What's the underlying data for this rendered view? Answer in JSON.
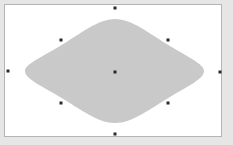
{
  "canvas": {
    "background_color": "#ffffff",
    "outer_color": "#e6e6e6",
    "border_color": "#b4b4b4"
  },
  "shape": {
    "type": "rounded-diamond",
    "fill_color": "#c9c9c9",
    "selected": true
  },
  "selection_handles": [
    {
      "name": "top",
      "x": 115,
      "y": 8
    },
    {
      "name": "top-left",
      "x": 61,
      "y": 40
    },
    {
      "name": "top-right",
      "x": 168,
      "y": 40
    },
    {
      "name": "left",
      "x": 8,
      "y": 71
    },
    {
      "name": "center",
      "x": 115,
      "y": 72
    },
    {
      "name": "right",
      "x": 220,
      "y": 72
    },
    {
      "name": "bottom-left",
      "x": 61,
      "y": 103
    },
    {
      "name": "bottom-right",
      "x": 168,
      "y": 103
    },
    {
      "name": "bottom",
      "x": 115,
      "y": 134
    }
  ]
}
